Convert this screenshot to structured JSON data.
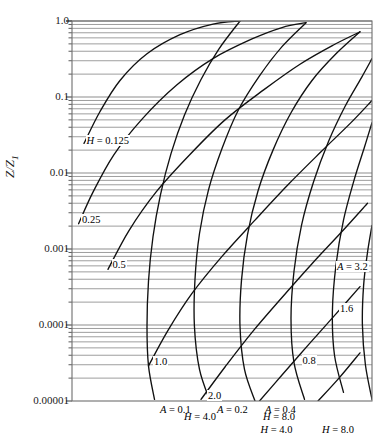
{
  "figure": {
    "kind": "nomograph",
    "background": "#ffffff",
    "ink": "#000000",
    "grid_color": "#8a8a8a"
  },
  "axis": {
    "y_label_main": "Z",
    "y_label_sub": "Z",
    "y_label_sub_index": "1",
    "y_label_text": "Z/Z1",
    "y_ticks": [
      "1.0",
      "0.1",
      "0.01",
      "0.001",
      "0.0001",
      "0.00001"
    ],
    "y_tick_values": [
      1.0,
      0.1,
      0.01,
      0.001,
      0.0001,
      1e-05
    ],
    "y_scale": "log",
    "minor_grid": true,
    "x_ticks": []
  },
  "curve_labels": {
    "h_family_label": "H",
    "a_family_label": "A",
    "h_labels": [
      "H = 0.125",
      "0.25",
      "0.5",
      "1.0",
      "2.0",
      "H = 4.0",
      "H = 8.0"
    ],
    "a_labels": [
      "A = 0.1",
      "A = 0.2",
      "A = 0.4",
      "0.8",
      "1.6",
      "A = 3.2"
    ]
  },
  "chart_data": {
    "type": "line",
    "title": "",
    "xlabel": "",
    "ylabel": "Z/Z1",
    "ylim": [
      1e-05,
      1.0
    ],
    "yscale": "log",
    "xlim": [
      0,
      1
    ],
    "grid": true,
    "legend": "none",
    "y_ticks": [
      1.0,
      0.1,
      0.01,
      0.001,
      0.0001,
      1e-05
    ],
    "y_tick_labels": [
      "1.0",
      "0.1",
      "0.01",
      "0.001",
      "0.0001",
      "0.00001"
    ],
    "series": [
      {
        "name": "H = 0.125",
        "family": "H",
        "value": 0.125,
        "points": [
          [
            0.04,
            0.0245
          ],
          [
            0.093,
            0.064
          ],
          [
            0.16,
            0.165
          ],
          [
            0.25,
            0.37
          ],
          [
            0.36,
            0.66
          ],
          [
            0.47,
            0.91
          ],
          [
            0.56,
            1.0
          ]
        ]
      },
      {
        "name": "0.25",
        "family": "H",
        "value": 0.25,
        "points": [
          [
            0.022,
            0.00215
          ],
          [
            0.07,
            0.0056
          ],
          [
            0.14,
            0.0175
          ],
          [
            0.235,
            0.052
          ],
          [
            0.35,
            0.145
          ],
          [
            0.47,
            0.32
          ],
          [
            0.6,
            0.58
          ],
          [
            0.7,
            0.82
          ],
          [
            0.78,
            0.95
          ]
        ]
      },
      {
        "name": "0.5",
        "family": "H",
        "value": 0.5,
        "points": [
          [
            0.12,
            0.00054
          ],
          [
            0.19,
            0.00175
          ],
          [
            0.28,
            0.0056
          ],
          [
            0.39,
            0.017
          ],
          [
            0.51,
            0.05
          ],
          [
            0.64,
            0.125
          ],
          [
            0.76,
            0.27
          ],
          [
            0.87,
            0.48
          ],
          [
            0.96,
            0.72
          ]
        ]
      },
      {
        "name": "1.0",
        "family": "H",
        "value": 1.0,
        "points": [
          [
            0.255,
            2.9e-05
          ],
          [
            0.32,
            8.5e-05
          ],
          [
            0.4,
            0.00026
          ],
          [
            0.5,
            0.0008
          ],
          [
            0.61,
            0.0024
          ],
          [
            0.72,
            0.007
          ],
          [
            0.83,
            0.019
          ],
          [
            0.93,
            0.046
          ],
          [
            1.0,
            0.09
          ]
        ]
      },
      {
        "name": "2.0",
        "family": "H",
        "value": 2.0,
        "points": [
          [
            0.43,
            1.05e-05
          ],
          [
            0.51,
            2.8e-05
          ],
          [
            0.6,
            8e-05
          ],
          [
            0.7,
            0.00023
          ],
          [
            0.8,
            0.00064
          ],
          [
            0.9,
            0.0017
          ],
          [
            0.985,
            0.004
          ]
        ]
      },
      {
        "name": "H = 4.0",
        "family": "H",
        "value": 4.0,
        "points": [
          [
            0.625,
            1e-05
          ],
          [
            0.7,
            2.2e-05
          ],
          [
            0.79,
            5.6e-05
          ],
          [
            0.88,
            0.00014
          ],
          [
            0.96,
            0.00032
          ]
        ]
      },
      {
        "name": "H = 8.0",
        "family": "H",
        "value": 8.0,
        "points": [
          [
            0.82,
            1e-05
          ],
          [
            0.89,
            2e-05
          ],
          [
            0.96,
            4.3e-05
          ]
        ]
      },
      {
        "name": "A = 0.1",
        "family": "A",
        "value": 0.1,
        "points": [
          [
            0.56,
            1.0
          ],
          [
            0.49,
            0.43
          ],
          [
            0.43,
            0.17
          ],
          [
            0.375,
            0.058
          ],
          [
            0.33,
            0.018
          ],
          [
            0.295,
            0.0052
          ],
          [
            0.27,
            0.00145
          ],
          [
            0.255,
            0.00038
          ],
          [
            0.25,
            9.5e-05
          ],
          [
            0.255,
            2.9e-05
          ],
          [
            0.275,
            1.05e-05
          ]
        ]
      },
      {
        "name": "A = 0.2",
        "family": "A",
        "value": 0.2,
        "points": [
          [
            0.78,
            0.95
          ],
          [
            0.7,
            0.46
          ],
          [
            0.625,
            0.19
          ],
          [
            0.555,
            0.068
          ],
          [
            0.5,
            0.021
          ],
          [
            0.455,
            0.006
          ],
          [
            0.425,
            0.0016
          ],
          [
            0.41,
            0.0004
          ],
          [
            0.408,
            9.8e-05
          ],
          [
            0.425,
            2.6e-05
          ],
          [
            0.46,
            1e-05
          ]
        ]
      },
      {
        "name": "A = 0.4",
        "family": "A",
        "value": 0.4,
        "points": [
          [
            0.96,
            0.72
          ],
          [
            0.88,
            0.37
          ],
          [
            0.8,
            0.165
          ],
          [
            0.73,
            0.062
          ],
          [
            0.67,
            0.02
          ],
          [
            0.62,
            0.0058
          ],
          [
            0.585,
            0.00155
          ],
          [
            0.565,
            0.00039
          ],
          [
            0.56,
            9.6e-05
          ],
          [
            0.575,
            2.6e-05
          ],
          [
            0.61,
            1e-05
          ]
        ]
      },
      {
        "name": "0.8",
        "family": "A",
        "value": 0.8,
        "points": [
          [
            1.0,
            0.32
          ],
          [
            0.965,
            0.18
          ],
          [
            0.91,
            0.075
          ],
          [
            0.855,
            0.026
          ],
          [
            0.805,
            0.0076
          ],
          [
            0.765,
            0.00205
          ],
          [
            0.74,
            0.00051
          ],
          [
            0.73,
            0.000122
          ],
          [
            0.74,
            3.2e-05
          ],
          [
            0.775,
            1.05e-05
          ]
        ]
      },
      {
        "name": "1.6",
        "family": "A",
        "value": 1.6,
        "points": [
          [
            1.0,
            0.046
          ],
          [
            0.975,
            0.022
          ],
          [
            0.94,
            0.008
          ],
          [
            0.905,
            0.0024
          ],
          [
            0.88,
            0.00062
          ],
          [
            0.868,
            0.00015
          ],
          [
            0.875,
            4e-05
          ],
          [
            0.905,
            1.3e-05
          ]
        ]
      },
      {
        "name": "A = 3.2",
        "family": "A",
        "value": 3.2,
        "points": [
          [
            1.0,
            0.00205
          ],
          [
            0.985,
            0.0009
          ],
          [
            0.972,
            0.00033
          ],
          [
            0.968,
            0.0001
          ],
          [
            0.978,
            3e-05
          ],
          [
            1.0,
            1.05e-05
          ]
        ]
      }
    ],
    "annotations": [
      {
        "text": "H = 0.125",
        "x": 0.045,
        "y": 0.026,
        "italic_prefix": "H"
      },
      {
        "text": "0.25",
        "x": 0.03,
        "y": 0.00235
      },
      {
        "text": "0.5",
        "x": 0.132,
        "y": 0.00059
      },
      {
        "text": "1.0",
        "x": 0.27,
        "y": 3.2e-05
      },
      {
        "text": "2.0",
        "x": 0.45,
        "y": 1.12e-05
      },
      {
        "text": "H = 4.0",
        "x": 0.625,
        "y": 4e-06,
        "italic_prefix": "H"
      },
      {
        "text": "H = 8.0",
        "x": 0.83,
        "y": 4e-06,
        "italic_prefix": "H"
      },
      {
        "text": "A = 0.1",
        "x": 0.29,
        "y": 7.5e-06,
        "italic_prefix": "A"
      },
      {
        "text": "A = 0.2",
        "x": 0.48,
        "y": 7.5e-06,
        "italic_prefix": "A"
      },
      {
        "text": "A = 0.4",
        "x": 0.64,
        "y": 7.5e-06,
        "italic_prefix": "A"
      },
      {
        "text": "0.8",
        "x": 0.765,
        "y": 3.3e-05
      },
      {
        "text": "1.6",
        "x": 0.89,
        "y": 0.00016
      },
      {
        "text": "A = 3.2",
        "x": 0.88,
        "y": 0.00056,
        "italic_prefix": "A"
      }
    ]
  }
}
